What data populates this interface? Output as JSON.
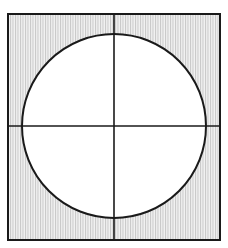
{
  "figure": {
    "canvas": {
      "width": 228,
      "height": 248,
      "background": "#ffffff"
    },
    "square": {
      "name": "outer-square",
      "x": 8,
      "y": 14,
      "width": 212,
      "height": 226,
      "stroke_color": "#1a1a1a",
      "stroke_width": 2,
      "fill_pattern": "vertical-hatch",
      "fill_description": "fine vertical grey stripes"
    },
    "hatch": {
      "name": "vertical-hatch-pattern",
      "line_color": "#c6c6c6",
      "background_color": "#f2f2f2",
      "spacing_px": 2.5,
      "line_width_px": 1,
      "orientation": "vertical"
    },
    "circle": {
      "name": "inscribed-circle",
      "center_x": 114,
      "center_y": 126,
      "radius": 92,
      "stroke_color": "#1a1a1a",
      "stroke_width": 2,
      "fill_color": "#ffffff"
    },
    "crosshair": {
      "name": "centre-crosshair",
      "stroke_color": "#1a1a1a",
      "stroke_width": 1.6,
      "vertical_line": {
        "x": 114,
        "y1": 14,
        "y2": 240
      },
      "horizontal_line": {
        "y": 126,
        "x1": 8,
        "x2": 220
      }
    }
  }
}
